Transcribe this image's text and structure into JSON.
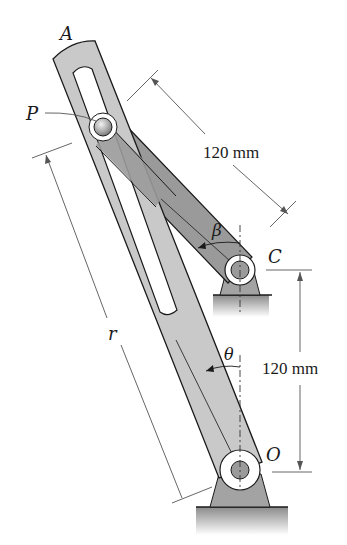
{
  "diagram": {
    "type": "mechanism",
    "labels": {
      "point_A": "A",
      "point_P": "P",
      "point_C": "C",
      "point_O": "O",
      "length_r": "r",
      "angle_beta": "β",
      "angle_theta": "θ"
    },
    "dimensions": {
      "crank_length": "120 mm",
      "pivot_separation": "120 mm"
    },
    "colors": {
      "slotted_arm": "#c9c9c9",
      "crank": "#9a9a9a",
      "support": "#a3a3a3",
      "ground": "#8c8c8c",
      "outline": "#1a1a1a",
      "dimension_line": "#555555"
    }
  }
}
